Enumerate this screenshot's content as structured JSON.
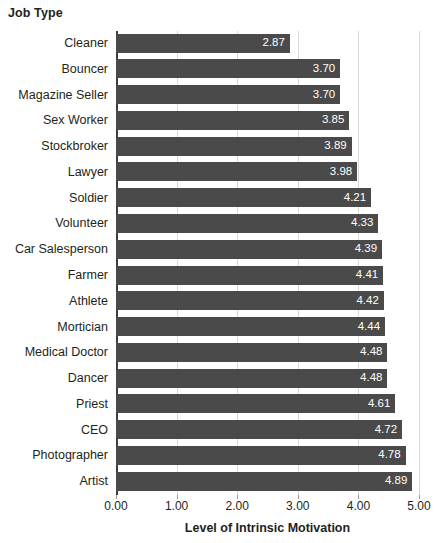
{
  "chart_data": {
    "type": "bar",
    "orientation": "horizontal",
    "title": "",
    "xlabel": "Level of Intrinsic Motivation",
    "ylabel": "Job Type",
    "xlim": [
      0.0,
      5.0
    ],
    "xticks": [
      "0.00",
      "1.00",
      "2.00",
      "3.00",
      "4.00",
      "5.00"
    ],
    "xtick_values": [
      0,
      1,
      2,
      3,
      4,
      5
    ],
    "grid": true,
    "legend": "none",
    "bar_color": "#4a4a4a",
    "value_label_color": "#ffffff",
    "categories": [
      "Cleaner",
      "Bouncer",
      "Magazine Seller",
      "Sex Worker",
      "Stockbroker",
      "Lawyer",
      "Soldier",
      "Volunteer",
      "Car Salesperson",
      "Farmer",
      "Athlete",
      "Mortician",
      "Medical Doctor",
      "Dancer",
      "Priest",
      "CEO",
      "Photographer",
      "Artist"
    ],
    "values": [
      2.87,
      3.7,
      3.7,
      3.85,
      3.89,
      3.98,
      4.21,
      4.33,
      4.39,
      4.41,
      4.42,
      4.44,
      4.48,
      4.48,
      4.61,
      4.72,
      4.78,
      4.89
    ],
    "value_labels": [
      "2.87",
      "3.70",
      "3.70",
      "3.85",
      "3.89",
      "3.98",
      "4.21",
      "4.33",
      "4.39",
      "4.41",
      "4.42",
      "4.44",
      "4.48",
      "4.48",
      "4.61",
      "4.72",
      "4.78",
      "4.89"
    ]
  }
}
